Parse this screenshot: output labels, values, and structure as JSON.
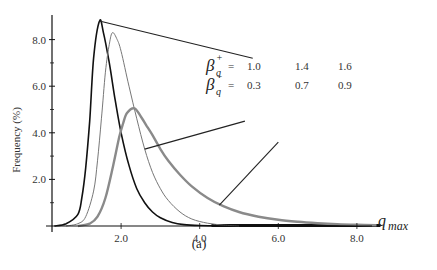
{
  "chart_data": {
    "type": "line",
    "title": "",
    "caption": "(a)",
    "xlabel": "q_max",
    "ylabel": "Frequency (%)",
    "xlim": [
      0,
      8.6
    ],
    "ylim": [
      0,
      9.0
    ],
    "x_ticks": [
      2.0,
      4.0,
      6.0,
      8.0
    ],
    "x_tick_labels": [
      "2.0",
      "4.0",
      "6.0",
      "8.0"
    ],
    "y_ticks": [
      2.0,
      4.0,
      6.0,
      8.0
    ],
    "y_tick_labels": [
      "2.0",
      "4.0",
      "6.0",
      "8.0"
    ],
    "y_minor_ticks": [
      1.0,
      3.0,
      5.0,
      7.0
    ],
    "grid": false,
    "legend": {
      "row1_symbol": "β_q^+",
      "row2_symbol": "β_q^-",
      "equals": "=",
      "beta_plus": [
        "1.0",
        "1.4",
        "1.6"
      ],
      "beta_minus": [
        "0.3",
        "0.7",
        "0.9"
      ]
    },
    "series": [
      {
        "name": "β+=1.0, β-=0.3",
        "color": "#111111",
        "width": 1.6,
        "x": [
          0.3,
          0.6,
          0.9,
          1.0,
          1.1,
          1.2,
          1.3,
          1.45,
          1.55,
          1.7,
          1.85,
          2.0,
          2.2,
          2.4,
          2.6,
          2.8,
          3.0,
          3.3,
          3.6,
          4.0,
          4.5,
          5.0
        ],
        "values": [
          0.0,
          0.1,
          0.5,
          1.2,
          2.5,
          4.5,
          7.2,
          8.8,
          8.3,
          7.0,
          5.4,
          4.0,
          2.6,
          1.6,
          1.0,
          0.6,
          0.35,
          0.15,
          0.06,
          0.02,
          0.01,
          0.0
        ]
      },
      {
        "name": "β+=1.4, β-=0.7",
        "color": "#777777",
        "width": 1.0,
        "x": [
          0.6,
          0.9,
          1.1,
          1.3,
          1.4,
          1.5,
          1.6,
          1.7,
          1.78,
          1.9,
          2.0,
          2.2,
          2.4,
          2.6,
          2.8,
          3.0,
          3.2,
          3.5,
          3.8,
          4.2,
          4.6,
          5.0
        ],
        "values": [
          0.0,
          0.1,
          0.4,
          1.5,
          2.8,
          4.6,
          6.6,
          7.8,
          8.3,
          8.0,
          7.5,
          6.0,
          4.6,
          3.3,
          2.3,
          1.6,
          1.1,
          0.6,
          0.3,
          0.12,
          0.04,
          0.0
        ]
      },
      {
        "name": "β+=1.6, β-=0.9",
        "color": "#8a8a8a",
        "width": 2.4,
        "x": [
          0.9,
          1.2,
          1.4,
          1.6,
          1.8,
          1.95,
          2.05,
          2.15,
          2.34,
          2.5,
          2.65,
          2.8,
          3.0,
          3.2,
          3.5,
          3.8,
          4.2,
          4.6,
          5.0,
          5.5,
          6.0,
          6.5,
          7.0,
          7.5,
          8.0,
          8.5
        ],
        "values": [
          0.0,
          0.1,
          0.4,
          1.2,
          2.6,
          3.8,
          4.4,
          4.85,
          5.05,
          4.7,
          4.3,
          3.9,
          3.3,
          2.8,
          2.2,
          1.7,
          1.2,
          0.85,
          0.6,
          0.4,
          0.27,
          0.18,
          0.12,
          0.08,
          0.05,
          0.03
        ]
      }
    ],
    "annotation_lines": [
      {
        "target_series": 0,
        "from": [
          1.45,
          8.8
        ],
        "to": [
          5.35,
          7.2
        ]
      },
      {
        "target_series": 1,
        "from": [
          2.6,
          3.3
        ],
        "to": [
          5.15,
          4.5
        ]
      },
      {
        "target_series": 2,
        "from": [
          4.5,
          0.9
        ],
        "to": [
          6.0,
          3.6
        ]
      }
    ]
  }
}
